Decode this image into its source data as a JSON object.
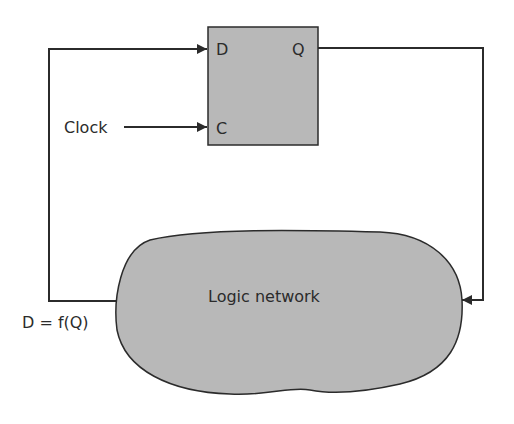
{
  "diagram": {
    "title": "",
    "flipflop": {
      "label_d": "D",
      "label_q": "Q",
      "label_c": "C",
      "fill": "#b8b8b8"
    },
    "clock_label": "Clock",
    "logic_label": "Logic network",
    "feedback_label": "D = f(Q)",
    "colors": {
      "line": "#2b2b2b",
      "shape_fill": "#b8b8b8",
      "background": "#ffffff"
    },
    "connections": [
      {
        "from": "flipflop.Q",
        "to": "logic-network"
      },
      {
        "from": "logic-network",
        "to": "flipflop.D",
        "label": "D = f(Q)"
      },
      {
        "from": "Clock",
        "to": "flipflop.C"
      }
    ]
  }
}
